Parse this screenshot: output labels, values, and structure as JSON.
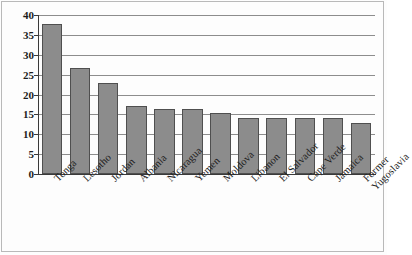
{
  "chart_data": {
    "type": "bar",
    "title": "",
    "subtitle": "",
    "xlabel": "",
    "ylabel": "",
    "ylim": [
      0,
      40
    ],
    "grid": true,
    "legend": false,
    "legend_position": "none",
    "orientation": "vertical",
    "bar_color": "#8c8c8c",
    "bar_border_color": "#4f4f4f",
    "gridline_color": "#8d8d8d",
    "axis_color": "#3a3a3a",
    "yticks": [
      0,
      5,
      10,
      15,
      20,
      25,
      30,
      35,
      40
    ],
    "ytick_labels": [
      "0",
      "5",
      "10",
      "15",
      "20",
      "25",
      "30",
      "35",
      "40"
    ],
    "categories": [
      "Tonga",
      "Lesotho",
      "Jordan",
      "Albania",
      "Nicaragua",
      "Yemen",
      "Moldova",
      "Libanon",
      "El Salvador",
      "Cape Verde",
      "Jamaica",
      "Former Yugoslavia"
    ],
    "category_lines": [
      [
        "Tonga"
      ],
      [
        "Lesotho"
      ],
      [
        "Jordan"
      ],
      [
        "Albania"
      ],
      [
        "Nicaragua"
      ],
      [
        "Yemen"
      ],
      [
        "Moldova"
      ],
      [
        "Libanon"
      ],
      [
        "El Salvador"
      ],
      [
        "Cape Verde"
      ],
      [
        "Jamaica"
      ],
      [
        "Former",
        "Yugoslavia"
      ]
    ],
    "values": [
      37.7,
      26.7,
      22.8,
      17.1,
      16.3,
      16.3,
      15.3,
      14.2,
      14.2,
      14.0,
      14.0,
      12.9
    ]
  }
}
